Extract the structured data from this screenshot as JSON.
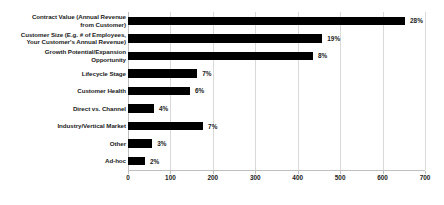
{
  "chart_data": {
    "type": "bar",
    "orientation": "horizontal",
    "title": "",
    "subtitle": "",
    "xlabel": "",
    "ylabel": "",
    "xlim": [
      0,
      700
    ],
    "xticks": [
      0,
      100,
      200,
      300,
      400,
      500,
      600,
      700
    ],
    "xtick_labels": [
      "0",
      "100",
      "200",
      "300",
      "400",
      "500",
      "600",
      "700"
    ],
    "grid": "vertical",
    "legend": "none",
    "bar_color": "#000000",
    "gridline_color": "#d9d9d9",
    "label_color": "#1a1a1a",
    "categories": [
      "Contract Value (Annual Revenue\nfrom Customer)",
      "Customer Size (E.g. # of Employees,\nYour Customer's Annual Revenue)",
      "Growth Potential/Expansion\nOpportunity",
      "Lifecycle Stage",
      "Customer Health",
      "Direct vs. Channel",
      "Industry/Vertical Market",
      "Other",
      "Ad-hoc"
    ],
    "values": [
      653,
      458,
      436,
      163,
      146,
      61,
      177,
      57,
      40
    ],
    "data_labels": [
      "28%",
      "19%",
      "8%",
      "7%",
      "6%",
      "4%",
      "7%",
      "3%",
      "2%"
    ]
  }
}
